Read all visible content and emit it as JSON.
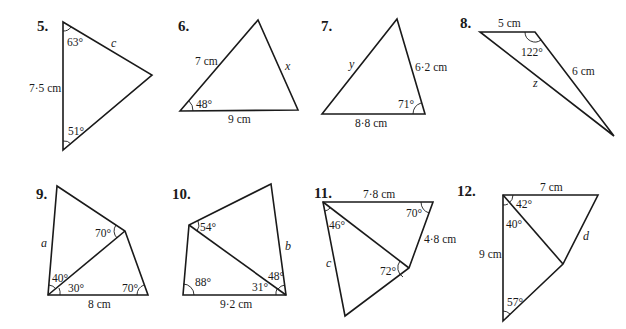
{
  "problems": [
    {
      "number": "5.",
      "side_labels": {
        "given": "7·5 cm",
        "unknown": "c"
      },
      "angles": [
        "63°",
        "51°"
      ]
    },
    {
      "number": "6.",
      "side_labels": {
        "left": "7 cm",
        "bottom": "9 cm",
        "unknown": "x"
      },
      "angles": [
        "48°"
      ]
    },
    {
      "number": "7.",
      "side_labels": {
        "right": "6·2 cm",
        "bottom": "8·8 cm",
        "unknown": "y"
      },
      "angles": [
        "71°"
      ]
    },
    {
      "number": "8.",
      "side_labels": {
        "top": "5 cm",
        "right": "6 cm",
        "unknown": "z"
      },
      "angles": [
        "122°"
      ]
    },
    {
      "number": "9.",
      "side_labels": {
        "bottom": "8 cm",
        "unknown": "a"
      },
      "angles": [
        "70°",
        "40°",
        "30°",
        "70°"
      ]
    },
    {
      "number": "10.",
      "side_labels": {
        "bottom": "9·2 cm",
        "unknown": "b"
      },
      "angles": [
        "54°",
        "88°",
        "31°",
        "48°"
      ]
    },
    {
      "number": "11.",
      "side_labels": {
        "top": "7·8 cm",
        "right": "4·8 cm",
        "unknown": "c"
      },
      "angles": [
        "70°",
        "46°",
        "72°"
      ]
    },
    {
      "number": "12.",
      "side_labels": {
        "top": "7 cm",
        "left": "9 cm",
        "unknown": "d"
      },
      "angles": [
        "42°",
        "40°",
        "57°"
      ]
    }
  ]
}
